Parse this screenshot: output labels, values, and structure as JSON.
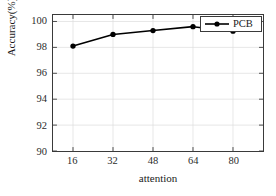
{
  "chart_data": {
    "type": "line",
    "title": "",
    "xlabel": "attention",
    "ylabel": "Accuracy(%)",
    "x": [
      16,
      32,
      48,
      64,
      80
    ],
    "xticklabels": [
      "16",
      "32",
      "48",
      "64",
      "80"
    ],
    "yticklabels": [
      "90",
      "92",
      "94",
      "96",
      "98",
      "100"
    ],
    "yticks": [
      90,
      92,
      94,
      96,
      98,
      100
    ],
    "xlim": [
      8,
      92
    ],
    "ylim": [
      90,
      100.5
    ],
    "grid": true,
    "legend_position": "upper right",
    "series": [
      {
        "name": "PCB",
        "values": [
          98.1,
          99.0,
          99.3,
          99.6,
          99.25
        ],
        "color": "#000000",
        "marker": "circle",
        "linewidth": 1.6
      }
    ]
  },
  "legend": {
    "entries": [
      {
        "label": "PCB"
      }
    ]
  },
  "axes": {
    "frame_color": "#3a3a3a",
    "grid_color": "#dcdcdc"
  }
}
